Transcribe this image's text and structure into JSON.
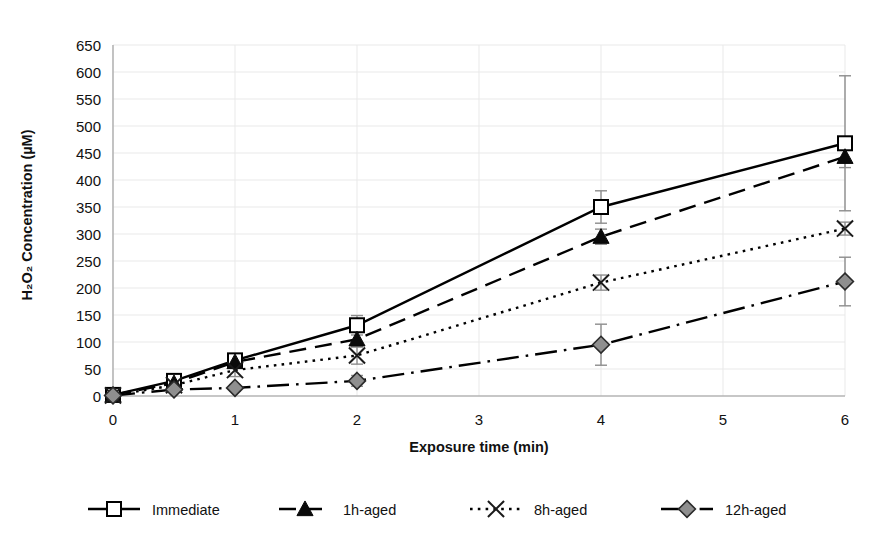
{
  "chart_data": {
    "type": "line",
    "title": "",
    "xlabel": "Exposure time (min)",
    "ylabel": "H₂O₂ Concentration (µM)",
    "xlim": [
      0,
      6
    ],
    "ylim": [
      0,
      650
    ],
    "ytick_step": 50,
    "xticks": [
      0,
      1,
      2,
      3,
      4,
      5,
      6
    ],
    "xtick_labels": [
      "0",
      "1",
      "2",
      "3",
      "4",
      "5",
      "6"
    ],
    "yticks": [
      0,
      50,
      100,
      150,
      200,
      250,
      300,
      350,
      400,
      450,
      500,
      550,
      600,
      650
    ],
    "ytick_labels": [
      "0",
      "50",
      "100",
      "150",
      "200",
      "250",
      "300",
      "350",
      "400",
      "450",
      "500",
      "550",
      "600",
      "650"
    ],
    "grid": true,
    "legend_position": "bottom",
    "x": [
      0,
      0.5,
      1,
      2,
      4,
      6
    ],
    "series": [
      {
        "name": "Immediate",
        "marker": "open-square",
        "linestyle": "solid",
        "color": "#000000",
        "values": [
          2,
          28,
          66,
          131,
          350,
          468
        ],
        "errors": [
          2,
          8,
          10,
          18,
          30,
          125
        ]
      },
      {
        "name": "1h-aged",
        "marker": "filled-triangle",
        "linestyle": "dashed",
        "color": "#000000",
        "values": [
          2,
          24,
          63,
          105,
          295,
          443
        ],
        "errors": [
          2,
          7,
          9,
          14,
          14,
          20
        ]
      },
      {
        "name": "8h-aged",
        "marker": "cross-x",
        "linestyle": "dotted",
        "color": "#1a1a1a",
        "values": [
          1,
          20,
          48,
          75,
          210,
          310
        ],
        "errors": [
          1,
          6,
          12,
          16,
          14,
          12
        ]
      },
      {
        "name": "12h-aged",
        "marker": "filled-diamond",
        "linestyle": "dashdot",
        "color": "#8f8f8f",
        "values": [
          1,
          12,
          15,
          28,
          95,
          212
        ],
        "errors": [
          1,
          5,
          6,
          10,
          38,
          45
        ]
      }
    ]
  },
  "legend": {
    "items": [
      {
        "label": "Immediate"
      },
      {
        "label": "1h-aged"
      },
      {
        "label": "8h-aged"
      },
      {
        "label": "12h-aged"
      }
    ]
  }
}
